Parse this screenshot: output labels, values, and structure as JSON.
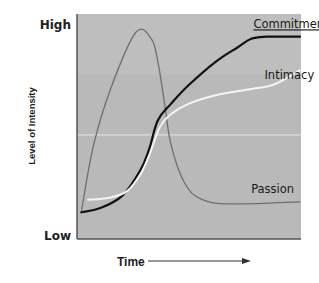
{
  "chart_data": {
    "type": "line",
    "title": "",
    "xlabel": "Time",
    "ylabel": "Level of Intensity",
    "y_tick_labels": [
      "Low",
      "High"
    ],
    "x_axis_arrow": true,
    "grid": false,
    "reference_line": {
      "y": 45,
      "color": "#e6e6e6"
    },
    "plot_background": "#b8b8b8",
    "xlim": [
      0,
      100
    ],
    "ylim": [
      0,
      100
    ],
    "legend": "inline labels",
    "series": [
      {
        "name": "Passion",
        "color": "#6e6e6e",
        "width": 1.3,
        "label_pos": [
          78,
          17
        ],
        "points": [
          [
            1.5,
            8
          ],
          [
            7,
            40
          ],
          [
            15,
            68
          ],
          [
            26,
            94
          ],
          [
            33,
            91
          ],
          [
            36,
            80
          ],
          [
            39,
            60
          ],
          [
            42,
            40
          ],
          [
            48,
            22
          ],
          [
            56,
            14
          ],
          [
            70,
            12
          ],
          [
            100,
            13
          ]
        ]
      },
      {
        "name": "Commitment",
        "color": "#111111",
        "width": 2.2,
        "label_pos": [
          79,
          96
        ],
        "underline": true,
        "points": [
          [
            1.5,
            8
          ],
          [
            10,
            10
          ],
          [
            20,
            16
          ],
          [
            28,
            28
          ],
          [
            32,
            38
          ],
          [
            36,
            52
          ],
          [
            42,
            60
          ],
          [
            50,
            69
          ],
          [
            62,
            80
          ],
          [
            72,
            87
          ],
          [
            78,
            91
          ],
          [
            85,
            92
          ],
          [
            100,
            92
          ]
        ]
      },
      {
        "name": "Intimacy",
        "color": "#f4f4f4",
        "width": 2.0,
        "label_pos": [
          84,
          72
        ],
        "points": [
          [
            4.5,
            14
          ],
          [
            14,
            15
          ],
          [
            22,
            18
          ],
          [
            28,
            26
          ],
          [
            32,
            35
          ],
          [
            37,
            49
          ],
          [
            42,
            55
          ],
          [
            50,
            60
          ],
          [
            62,
            64
          ],
          [
            78,
            67
          ],
          [
            88,
            69
          ],
          [
            100,
            76
          ]
        ]
      }
    ]
  }
}
